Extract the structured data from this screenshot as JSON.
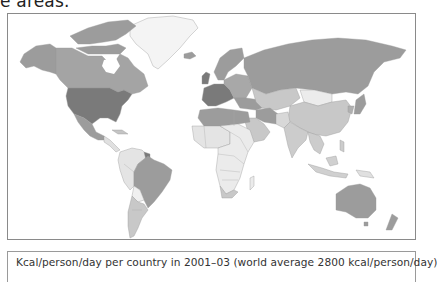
{
  "page": {
    "top_text_fragment": "e areas."
  },
  "map": {
    "title": "World map: food energy supply per capita",
    "style": "grayscale choropleth",
    "shades": {
      "highest": "#7a7a7a",
      "high": "#9c9c9c",
      "medium": "#c4c4c4",
      "low": "#e4e4e4",
      "no_data": "#f6f6f6",
      "border": "#8a8a8a",
      "ocean": "#ffffff"
    },
    "regions": [
      {
        "name": "United States",
        "shade": "highest"
      },
      {
        "name": "Western Europe",
        "shade": "highest"
      },
      {
        "name": "Canada",
        "shade": "high"
      },
      {
        "name": "Alaska",
        "shade": "high"
      },
      {
        "name": "Mexico",
        "shade": "high"
      },
      {
        "name": "Russia",
        "shade": "high"
      },
      {
        "name": "Eastern Europe",
        "shade": "high"
      },
      {
        "name": "North Africa",
        "shade": "high"
      },
      {
        "name": "Brazil",
        "shade": "high"
      },
      {
        "name": "Australia",
        "shade": "high"
      },
      {
        "name": "Turkey / Middle East",
        "shade": "high"
      },
      {
        "name": "Japan / Korea",
        "shade": "high"
      },
      {
        "name": "China",
        "shade": "medium"
      },
      {
        "name": "Central Asia",
        "shade": "medium"
      },
      {
        "name": "Argentina / Southern Cone",
        "shade": "medium"
      },
      {
        "name": "India",
        "shade": "medium"
      },
      {
        "name": "Arabian Peninsula",
        "shade": "medium"
      },
      {
        "name": "Southeast Asia",
        "shade": "medium"
      },
      {
        "name": "South Africa",
        "shade": "medium"
      },
      {
        "name": "Sub-Saharan Africa",
        "shade": "low"
      },
      {
        "name": "Andean South America",
        "shade": "low"
      },
      {
        "name": "Mongolia",
        "shade": "low"
      },
      {
        "name": "Greenland",
        "shade": "no_data"
      }
    ]
  },
  "caption": {
    "text": "Kcal/person/day per country in 2001–03 (world average 2800 kcal/person/day)"
  }
}
